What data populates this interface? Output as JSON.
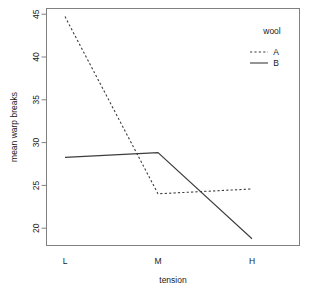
{
  "chart_data": {
    "type": "line",
    "title": "",
    "subtitle": "",
    "xlabel": "tension",
    "ylabel": "mean warp breaks",
    "categories": [
      "L",
      "M",
      "H"
    ],
    "x": [
      1,
      2,
      3
    ],
    "series": [
      {
        "name": "A",
        "values": [
          44.56,
          24.0,
          24.56
        ],
        "style": "dashed"
      },
      {
        "name": "B",
        "values": [
          28.22,
          28.78,
          18.78
        ],
        "style": "solid"
      }
    ],
    "ylim": [
      18.0,
      45.5
    ],
    "yticks": [
      20,
      25,
      30,
      35,
      40,
      45
    ],
    "ytick_labels": [
      "20",
      "25",
      "30",
      "35",
      "40",
      "45"
    ],
    "xtick_labels": [
      "L",
      "M",
      "H"
    ],
    "grid": false,
    "legend": {
      "title": "wool",
      "position": "top-right",
      "entries": [
        {
          "label": "A",
          "style": "dashed"
        },
        {
          "label": "B",
          "style": "solid"
        }
      ]
    },
    "colors": {
      "series_line": "#3c3c3c",
      "axis": "#808080",
      "text": "#1a1a1a",
      "background": "#ffffff"
    }
  },
  "axis": {
    "y_label": "mean warp breaks",
    "x_label": "tension",
    "y_ticks": [
      "20",
      "25",
      "30",
      "35",
      "40",
      "45"
    ],
    "x_ticks": [
      "L",
      "M",
      "H"
    ]
  },
  "legend": {
    "title": "wool",
    "item_a": "A",
    "item_b": "B"
  }
}
